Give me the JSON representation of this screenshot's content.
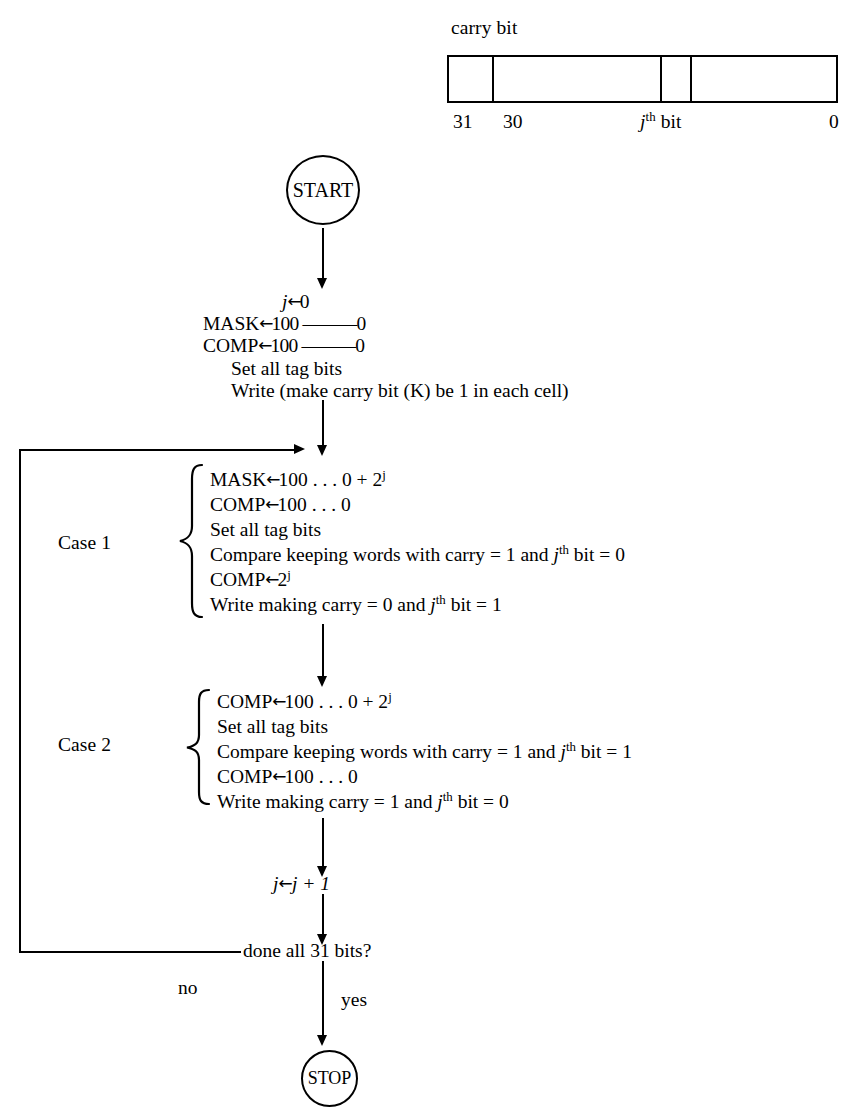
{
  "word_format": {
    "carry_bit_label": "carry bit",
    "bit_labels": [
      "31",
      "30",
      "0"
    ],
    "jth_bit_label_prefix": "j",
    "jth_bit_label_sup": "th",
    "jth_bit_label_suffix": " bit"
  },
  "nodes": {
    "start": "START",
    "stop": "STOP"
  },
  "init_block": {
    "line1_lhs": "j",
    "line1_arrow": "←",
    "line1_rhs": "0",
    "line2_lhs": "MASK",
    "line2_arrow": "←",
    "line2_rhs": "100 ––––––0",
    "line3_lhs": "COMP",
    "line3_arrow": "←",
    "line3_rhs": "100 ––––––0",
    "line4": "Set all tag bits",
    "line5": "Write (make carry bit (K) be 1 in each cell)"
  },
  "case1": {
    "label": "Case 1",
    "lines": [
      {
        "lhs": "MASK",
        "arrow": "←",
        "rhs": "100 . . . 0 + 2",
        "sup": "j"
      },
      {
        "lhs": "COMP",
        "arrow": "←",
        "rhs": "100 . . . 0",
        "sup": ""
      },
      {
        "plain": "Set all tag bits"
      },
      {
        "plain_pre": "Compare keeping words with carry = 1 and ",
        "ital": "j",
        "sup": "th",
        "plain_post": " bit = 0"
      },
      {
        "lhs": "COMP",
        "arrow": "←",
        "rhs": "2",
        "sup": "j"
      },
      {
        "plain_pre": "Write making carry = 0 and ",
        "ital": "j",
        "sup": "th",
        "plain_post": " bit = 1"
      }
    ]
  },
  "case2": {
    "label": "Case 2",
    "lines": [
      {
        "lhs": "COMP",
        "arrow": "←",
        "rhs": "100 . . . 0 + 2",
        "sup": "j"
      },
      {
        "plain": "Set all tag bits"
      },
      {
        "plain_pre": "Compare keeping words with carry = 1 and ",
        "ital": "j",
        "sup": "th",
        "plain_post": " bit = 1"
      },
      {
        "lhs": "COMP",
        "arrow": "←",
        "rhs": "100 . . . 0",
        "sup": ""
      },
      {
        "plain_pre": "Write making carry = 1 and ",
        "ital": "j",
        "sup": "th",
        "plain_post": " bit = 0"
      }
    ]
  },
  "increment": {
    "lhs": "j",
    "arrow": "←",
    "rhs": "j + 1"
  },
  "decision": {
    "question": "done all 31 bits?",
    "no_label": "no",
    "yes_label": "yes"
  },
  "colors": {
    "ink": "#000000",
    "paper": "#ffffff"
  }
}
